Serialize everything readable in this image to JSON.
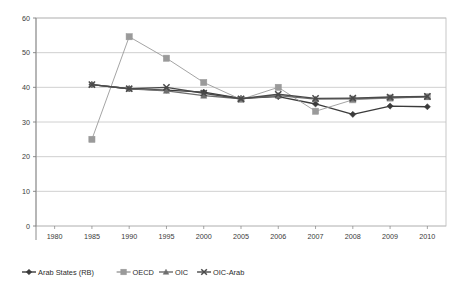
{
  "chart_data": {
    "type": "line",
    "title": "",
    "subtitle": "",
    "xlabel": "",
    "ylabel": "",
    "categories": [
      "1980",
      "1985",
      "1990",
      "1995",
      "2000",
      "2005",
      "2006",
      "2007",
      "2008",
      "2009",
      "2010"
    ],
    "xtick_labels": [
      "1980",
      "1985",
      "1990",
      "1995",
      "2000",
      "2005",
      "2006",
      "2007",
      "2008",
      "2009",
      "2010"
    ],
    "ytick_labels": [
      "0",
      "10",
      "20",
      "30",
      "40",
      "50",
      "60"
    ],
    "ytick_values": [
      0,
      10,
      20,
      30,
      40,
      50,
      60
    ],
    "ylim": [
      0,
      60
    ],
    "grid": "horizontal",
    "legend_position": "bottom-left",
    "series": [
      {
        "name": "Arab States (RB)",
        "marker": "diamond",
        "color": "#3b3b3b",
        "values": [
          null,
          40.8,
          39.6,
          39.2,
          38.6,
          36.8,
          37.3,
          35.2,
          32.2,
          34.6,
          34.4
        ]
      },
      {
        "name": "OECD",
        "marker": "square",
        "color": "#9a9a9a",
        "values": [
          null,
          25.0,
          54.6,
          48.4,
          41.4,
          36.5,
          40.0,
          33.1,
          36.4,
          36.9,
          37.3
        ]
      },
      {
        "name": "OIC",
        "marker": "triangle",
        "color": "#6e6e6e",
        "values": [
          null,
          40.8,
          39.6,
          39.0,
          37.6,
          36.7,
          37.6,
          36.6,
          36.7,
          37.0,
          37.2
        ]
      },
      {
        "name": "OIC-Arab",
        "marker": "cross",
        "color": "#4a4a4a",
        "values": [
          null,
          40.8,
          39.6,
          40.0,
          38.3,
          36.7,
          38.0,
          36.8,
          36.9,
          37.2,
          37.4
        ]
      }
    ]
  },
  "legend": {
    "items": [
      {
        "label": "Arab States (RB)",
        "marker": "diamond"
      },
      {
        "label": "OECD",
        "marker": "square"
      },
      {
        "label": "OIC",
        "marker": "triangle"
      },
      {
        "label": "OIC-Arab",
        "marker": "cross"
      }
    ]
  },
  "colors": {
    "plot_border": "#b8b8b8",
    "gridline": "#c4c4c4",
    "axis": "#808080",
    "background": "#ffffff",
    "series_1": "#3b3b3b",
    "series_2": "#9a9a9a",
    "series_3": "#6e6e6e",
    "series_4": "#4a4a4a"
  }
}
